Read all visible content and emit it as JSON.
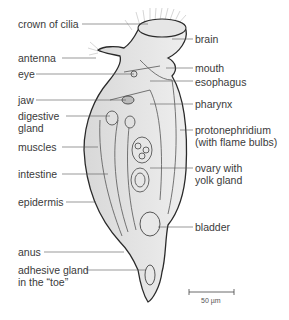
{
  "diagram": {
    "labels_left": [
      {
        "id": "crown-of-cilia",
        "text": "crown of cilia",
        "x": 18,
        "y": 18
      },
      {
        "id": "antenna",
        "text": "antenna",
        "x": 18,
        "y": 52
      },
      {
        "id": "eye",
        "text": "eye",
        "x": 18,
        "y": 68
      },
      {
        "id": "jaw",
        "text": "jaw",
        "x": 18,
        "y": 94
      },
      {
        "id": "digestive-gland",
        "text": "digestive\ngland",
        "x": 18,
        "y": 110
      },
      {
        "id": "muscles",
        "text": "muscles",
        "x": 18,
        "y": 141
      },
      {
        "id": "intestine",
        "text": "intestine",
        "x": 18,
        "y": 168
      },
      {
        "id": "epidermis",
        "text": "epidermis",
        "x": 18,
        "y": 196
      },
      {
        "id": "anus",
        "text": "anus",
        "x": 18,
        "y": 246
      },
      {
        "id": "adhesive-gland",
        "text": "adhesive gland\nin the “toe”",
        "x": 18,
        "y": 264
      }
    ],
    "labels_right": [
      {
        "id": "brain",
        "text": "brain",
        "x": 195,
        "y": 33
      },
      {
        "id": "mouth",
        "text": "mouth",
        "x": 195,
        "y": 62
      },
      {
        "id": "esophagus",
        "text": "esophagus",
        "x": 195,
        "y": 76
      },
      {
        "id": "pharynx",
        "text": "pharynx",
        "x": 195,
        "y": 98
      },
      {
        "id": "protonephridium",
        "text": "protonephridium\n(with flame bulbs)",
        "x": 195,
        "y": 124
      },
      {
        "id": "ovary",
        "text": "ovary with\nyolk gland",
        "x": 195,
        "y": 162
      },
      {
        "id": "bladder",
        "text": "bladder",
        "x": 195,
        "y": 221
      }
    ],
    "scale_bar": {
      "text": "50 µm"
    }
  }
}
